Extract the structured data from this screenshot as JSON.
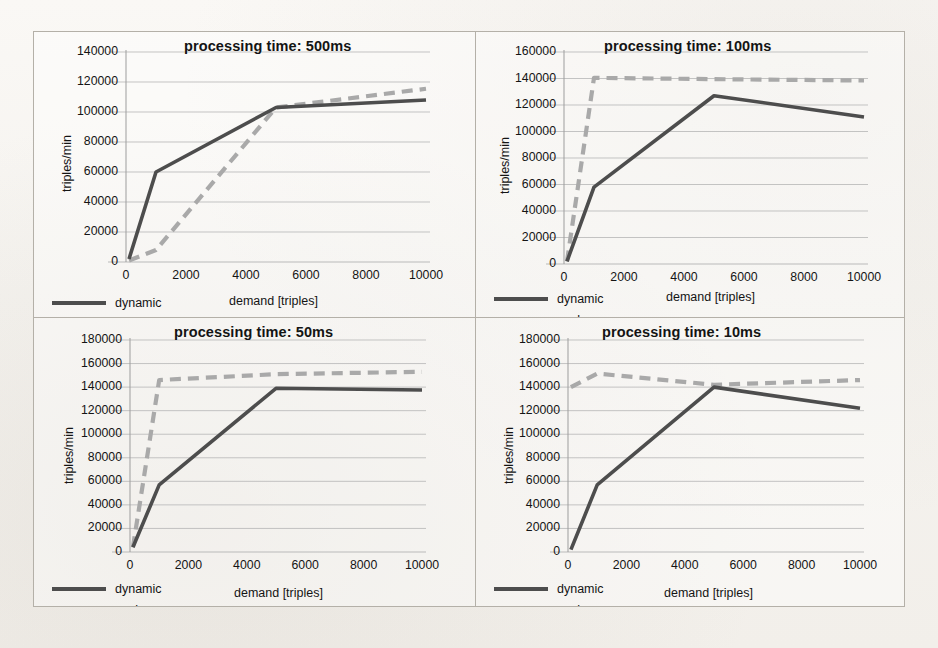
{
  "figure": {
    "background_color": "#f7f5f2",
    "border_color": "#b4b0a8"
  },
  "series_style": {
    "dynamic_color": "#4d4d4d",
    "push_color": "#a9a9a9",
    "dynamic_label": "dynamic",
    "push_label": "push"
  },
  "axis": {
    "ylabel": "triples/min",
    "xlabel": "demand [triples]",
    "xticks": [
      "0",
      "2000",
      "4000",
      "6000",
      "8000",
      "10000"
    ]
  },
  "panels": [
    {
      "id": "panel-500ms",
      "title": "processing time: 500ms",
      "yticks": [
        "0",
        "20000",
        "40000",
        "60000",
        "80000",
        "100000",
        "120000",
        "140000"
      ]
    },
    {
      "id": "panel-100ms",
      "title": "processing time: 100ms",
      "yticks": [
        "0",
        "20000",
        "40000",
        "60000",
        "80000",
        "100000",
        "120000",
        "140000",
        "160000"
      ]
    },
    {
      "id": "panel-50ms",
      "title": "processing time: 50ms",
      "yticks": [
        "0",
        "20000",
        "40000",
        "60000",
        "80000",
        "100000",
        "120000",
        "140000",
        "160000",
        "180000"
      ]
    },
    {
      "id": "panel-10ms",
      "title": "processing time: 10ms",
      "yticks": [
        "0",
        "20000",
        "40000",
        "60000",
        "80000",
        "100000",
        "120000",
        "140000",
        "160000",
        "180000"
      ]
    }
  ],
  "chart_data": [
    {
      "type": "line",
      "title": "processing time: 500ms",
      "xlabel": "demand [triples]",
      "ylabel": "triples/min",
      "xlim": [
        0,
        10000
      ],
      "ylim": [
        0,
        140000
      ],
      "ytick_step": 20000,
      "grid": true,
      "legend_position": "below-left",
      "x": [
        100,
        1000,
        5000,
        10000
      ],
      "series": [
        {
          "name": "dynamic",
          "style": "solid",
          "color": "#4d4d4d",
          "values": [
            2000,
            60000,
            103000,
            108000
          ]
        },
        {
          "name": "push",
          "style": "dashed",
          "color": "#a9a9a9",
          "values": [
            1000,
            8000,
            103000,
            115500
          ]
        }
      ]
    },
    {
      "type": "line",
      "title": "processing time: 100ms",
      "xlabel": "demand [triples]",
      "ylabel": "triples/min",
      "xlim": [
        0,
        10000
      ],
      "ylim": [
        0,
        160000
      ],
      "ytick_step": 20000,
      "grid": true,
      "legend_position": "below-left",
      "x": [
        100,
        1000,
        5000,
        10000
      ],
      "series": [
        {
          "name": "dynamic",
          "style": "solid",
          "color": "#4d4d4d",
          "values": [
            2000,
            58000,
            127000,
            111000
          ]
        },
        {
          "name": "push",
          "style": "dashed",
          "color": "#a9a9a9",
          "values": [
            2000,
            140500,
            139500,
            138500
          ]
        }
      ]
    },
    {
      "type": "line",
      "title": "processing time: 50ms",
      "xlabel": "demand [triples]",
      "ylabel": "triples/min",
      "xlim": [
        0,
        10000
      ],
      "ylim": [
        0,
        180000
      ],
      "ytick_step": 20000,
      "grid": true,
      "legend_position": "below-left",
      "x": [
        100,
        1000,
        5000,
        10000
      ],
      "series": [
        {
          "name": "dynamic",
          "style": "solid",
          "color": "#4d4d4d",
          "values": [
            4000,
            57000,
            139000,
            137500
          ]
        },
        {
          "name": "push",
          "style": "dashed",
          "color": "#a9a9a9",
          "values": [
            4000,
            146000,
            151000,
            153000
          ]
        }
      ]
    },
    {
      "type": "line",
      "title": "processing time: 10ms",
      "xlabel": "demand [triples]",
      "ylabel": "triples/min",
      "xlim": [
        0,
        10000
      ],
      "ylim": [
        0,
        180000
      ],
      "ytick_step": 20000,
      "grid": true,
      "legend_position": "below-left",
      "x": [
        100,
        1000,
        5000,
        10000
      ],
      "series": [
        {
          "name": "dynamic",
          "style": "solid",
          "color": "#4d4d4d",
          "values": [
            2000,
            57000,
            140000,
            122000
          ]
        },
        {
          "name": "push",
          "style": "dashed",
          "color": "#a9a9a9",
          "values": [
            140000,
            151500,
            142000,
            146000
          ]
        }
      ]
    }
  ]
}
